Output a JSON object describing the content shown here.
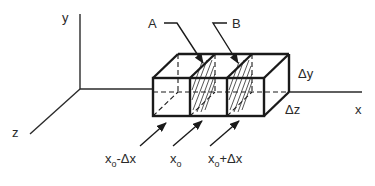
{
  "diagram": {
    "type": "control-volume-3d",
    "axes": {
      "x_label": "x",
      "y_label": "y",
      "z_label": "z"
    },
    "planes": {
      "a_label": "A",
      "b_label": "B"
    },
    "dimensions": {
      "dy_label": "Δy",
      "dz_label": "Δz"
    },
    "positions": [
      {
        "main": "x",
        "sub": "o",
        "suffix": "-Δx"
      },
      {
        "main": "x",
        "sub": "o",
        "suffix": ""
      },
      {
        "main": "x",
        "sub": "o",
        "suffix": "+Δx"
      }
    ],
    "colors": {
      "line": "#1a1a1a",
      "background": "#ffffff"
    }
  }
}
